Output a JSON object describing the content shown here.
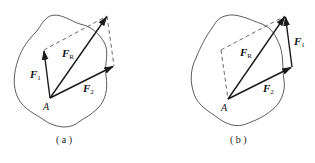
{
  "figure": {
    "panels": [
      {
        "id": "a",
        "caption": "( a )",
        "point_label": "A",
        "vectors": {
          "F1": {
            "label": "F",
            "sub": "1"
          },
          "F2": {
            "label": "F",
            "sub": "2"
          },
          "FR": {
            "label": "F",
            "sub": "R"
          }
        },
        "construction": "parallelogram"
      },
      {
        "id": "b",
        "caption": "( b )",
        "point_label": "A",
        "vectors": {
          "F1": {
            "label": "F",
            "sub": "1"
          },
          "F2": {
            "label": "F",
            "sub": "2"
          },
          "FR": {
            "label": "F",
            "sub": "R"
          }
        },
        "construction": "triangle"
      }
    ],
    "colors": {
      "stroke": "#1a1a1a",
      "dash": "#444444",
      "outline": "#333333"
    }
  }
}
